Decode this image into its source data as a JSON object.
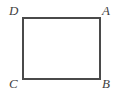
{
  "figure": {
    "name": "rectangle-abcd",
    "canvas": {
      "width": 124,
      "height": 95,
      "background_color": "#ffffff"
    },
    "shape": {
      "type": "rectangle",
      "stroke_color": "#4a4a4a",
      "stroke_width": 2,
      "fill_color": "#ffffff",
      "x": 23,
      "y": 18,
      "width": 77,
      "height": 61
    },
    "labels": [
      {
        "id": "D",
        "text": "D",
        "corner": "top-left",
        "x": 9,
        "y": 4,
        "style": "italic"
      },
      {
        "id": "A",
        "text": "A",
        "corner": "top-right",
        "x": 102,
        "y": 4,
        "style": "italic"
      },
      {
        "id": "C",
        "text": "C",
        "corner": "bottom-left",
        "x": 9,
        "y": 77,
        "style": "italic"
      },
      {
        "id": "B",
        "text": "B",
        "corner": "bottom-right",
        "x": 102,
        "y": 77,
        "style": "italic"
      }
    ]
  }
}
